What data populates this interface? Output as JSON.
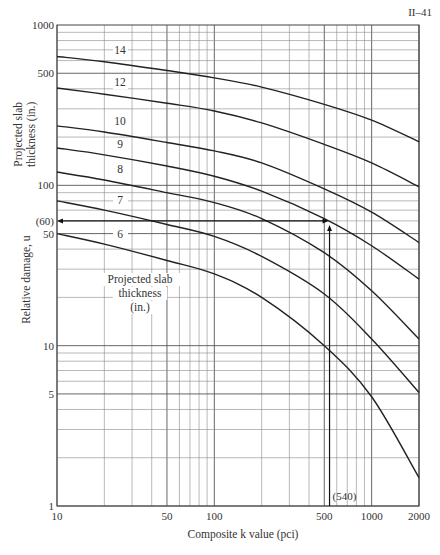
{
  "page_ref": "II–41",
  "chart_data": {
    "type": "line",
    "title": "",
    "xlabel": "Composite k value (pci)",
    "ylabel": "Relative damage, u",
    "y2label": "Projected slab thickness (in.)",
    "legend_title": "Projected slab thickness (in.)",
    "xscale": "log",
    "yscale": "log",
    "xlim": [
      10,
      2000
    ],
    "ylim": [
      1,
      1000
    ],
    "grid": true,
    "x_ticks": [
      10,
      50,
      100,
      500,
      1000,
      2000
    ],
    "x_tick_labels": [
      "10",
      "50",
      "100",
      "500",
      "1000",
      "2000"
    ],
    "y_ticks": [
      1,
      5,
      10,
      50,
      100,
      500,
      1000
    ],
    "y_tick_labels": [
      "1",
      "5",
      "10",
      "50",
      "100",
      "500",
      "1000"
    ],
    "x": [
      10,
      20,
      50,
      100,
      200,
      500,
      1000,
      2000
    ],
    "series": [
      {
        "name": "14",
        "values": [
          636,
          590,
          520,
          468,
          410,
          320,
          255,
          187
        ]
      },
      {
        "name": "12",
        "values": [
          405,
          370,
          325,
          291,
          245,
          180,
          138,
          98
        ]
      },
      {
        "name": "10",
        "values": [
          235,
          215,
          185,
          164,
          138,
          95,
          68,
          44
        ]
      },
      {
        "name": "9",
        "values": [
          171,
          155,
          132,
          114,
          92,
          62,
          42,
          26
        ]
      },
      {
        "name": "8",
        "values": [
          121,
          108,
          90,
          78,
          62,
          38,
          22,
          11
        ]
      },
      {
        "name": "7",
        "values": [
          80,
          70,
          57,
          48,
          36,
          21,
          11,
          5.1
        ]
      },
      {
        "name": "6",
        "values": [
          50,
          43,
          34,
          28,
          20,
          10,
          4.8,
          1.5
        ]
      }
    ],
    "annotations": [
      {
        "text": "(60)",
        "type": "horizontal-arrow",
        "y": 60,
        "from_x": 540,
        "to_x": 10
      },
      {
        "text": "(540)",
        "type": "vertical-line",
        "x": 540,
        "from_y": 1,
        "to_y": 60
      }
    ]
  }
}
